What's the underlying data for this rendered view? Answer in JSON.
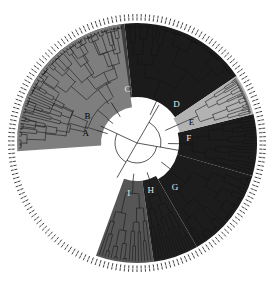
{
  "figure": {
    "type": "circular-phylogenetic-tree",
    "title": "",
    "background_color": "#ffffff",
    "center": {
      "x": 137,
      "y": 143
    },
    "hub_radius": 27,
    "tree_outer_radius": 118,
    "tip_ring_radius": 126,
    "branch_color": "#101010",
    "tip_tick_color": "#2b2b2b",
    "n_leaves": 190
  },
  "palette": {
    "near_black": "#1b1b1b",
    "dark_gray": "#3d3d3d",
    "mid_dark_gray": "#565656",
    "mid_gray": "#7e7e7e",
    "gray": "#8d8d8d",
    "light_gray": "#b2b2b2",
    "hub_white": "#fdfdfd",
    "ring_white": "#f4f4f4"
  },
  "chart_data": {
    "type": "tree",
    "layout": "circular",
    "xlabel": "",
    "ylabel": "",
    "legend_position": "none",
    "grid": false,
    "sectors": [
      {
        "id": "sector-1",
        "label": "D",
        "fill": "#1b1b1b",
        "start_angle": -96,
        "end_angle": -34,
        "inner_radius": 46,
        "outer_radius": 120,
        "n_tips": 34,
        "label_angle": -44,
        "label_radius": 55,
        "label_on_dark": true
      },
      {
        "id": "sector-2",
        "label": "C",
        "fill": "#3d3d3d",
        "start_angle": -149,
        "end_angle": -96,
        "inner_radius": 46,
        "outer_radius": 120,
        "n_tips": 30,
        "label_angle": -100,
        "label_radius": 54,
        "label_on_dark": true
      },
      {
        "id": "sector-3",
        "label": "B",
        "fill": "#8d8d8d",
        "start_angle": -176,
        "end_angle": -149,
        "inner_radius": 40,
        "outer_radius": 120,
        "n_tips": 18,
        "label_angle": -152,
        "label_radius": 56,
        "label_on_dark": false
      },
      {
        "id": "sector-4",
        "label": "A",
        "fill": "#7e7e7e",
        "start_angle": 176,
        "end_angle": 262,
        "inner_radius": 36,
        "outer_radius": 120,
        "n_tips": 44,
        "label_angle": 190,
        "label_radius": 52,
        "label_on_dark": false
      },
      {
        "id": "sector-5",
        "label": "I",
        "fill": "#565656",
        "start_angle": 82,
        "end_angle": 110,
        "inner_radius": 38,
        "outer_radius": 120,
        "n_tips": 18,
        "label_angle": 99,
        "label_radius": 52,
        "label_on_dark": true
      },
      {
        "id": "sector-6",
        "label": "H",
        "fill": "#1f1f1f",
        "start_angle": 60,
        "end_angle": 82,
        "inner_radius": 38,
        "outer_radius": 120,
        "n_tips": 14,
        "label_angle": 74,
        "label_radius": 50,
        "label_on_dark": true
      },
      {
        "id": "sector-7",
        "label": "G",
        "fill": "#1c1c1c",
        "start_angle": 16,
        "end_angle": 60,
        "inner_radius": 42,
        "outer_radius": 120,
        "n_tips": 24,
        "label_angle": 50,
        "label_radius": 59,
        "label_on_dark": true
      },
      {
        "id": "sector-8",
        "label": "F",
        "fill": "#1c1c1c",
        "start_angle": -14,
        "end_angle": 16,
        "inner_radius": 42,
        "outer_radius": 120,
        "n_tips": 18,
        "label_angle": -4,
        "label_radius": 52,
        "label_on_dark": true
      },
      {
        "id": "sector-9",
        "label": "E",
        "fill": "#b2b2b2",
        "start_angle": -34,
        "end_angle": -14,
        "inner_radius": 44,
        "outer_radius": 120,
        "n_tips": 40,
        "label_angle": -20,
        "label_radius": 58,
        "label_on_dark": false
      }
    ],
    "clade_labels": [
      "A",
      "B",
      "C",
      "D",
      "E",
      "F",
      "G",
      "H",
      "I"
    ],
    "root_branches": [
      {
        "angle": -60,
        "radius": 44
      },
      {
        "angle": 10,
        "radius": 42
      },
      {
        "angle": 120,
        "radius": 40
      },
      {
        "angle": 205,
        "radius": 40
      }
    ]
  }
}
